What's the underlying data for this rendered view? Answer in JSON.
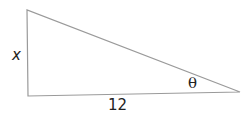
{
  "diagram": {
    "type": "right-triangle",
    "labels": {
      "vertical_side": "x",
      "horizontal_side": "12",
      "angle": "θ"
    },
    "colors": {
      "stroke": "#9a9a9a",
      "text": "#222222",
      "background": "#ffffff"
    }
  }
}
